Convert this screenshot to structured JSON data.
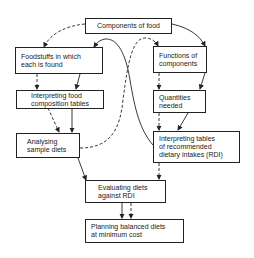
{
  "diagram": {
    "nodes": [
      {
        "id": "components",
        "label": "Components of food"
      },
      {
        "id": "foodstuffs",
        "label": "Foodstuffs in which\neach is found"
      },
      {
        "id": "functions",
        "label": "Functions of\ncomponents"
      },
      {
        "id": "interp_food",
        "label": "Interpreting food\ncomposition tables"
      },
      {
        "id": "quantities",
        "label": "Quantities\nneeded"
      },
      {
        "id": "analysing",
        "label": "Analysing\nsample diets"
      },
      {
        "id": "interp_rdi",
        "label": "Interpreting tables\nof recommended\ndietary intakes (RDI)"
      },
      {
        "id": "evaluating",
        "label": "Evaluating diets\nagainst RDI"
      },
      {
        "id": "planning",
        "label": "Planning balanced diets\nat minimum cost"
      }
    ],
    "edges": [
      {
        "from": "components",
        "to": "foodstuffs",
        "style": "dashed"
      },
      {
        "from": "components",
        "to": "functions",
        "style": "solid"
      },
      {
        "from": "foodstuffs",
        "to": "interp_food",
        "style": "dashed"
      },
      {
        "from": "foodstuffs",
        "to": "interp_food",
        "style": "solid"
      },
      {
        "from": "functions",
        "to": "quantities",
        "style": "dashed"
      },
      {
        "from": "functions",
        "to": "quantities",
        "style": "solid"
      },
      {
        "from": "interp_food",
        "to": "analysing",
        "style": "dashed"
      },
      {
        "from": "interp_food",
        "to": "analysing",
        "style": "solid"
      },
      {
        "from": "quantities",
        "to": "interp_rdi",
        "style": "dashed"
      },
      {
        "from": "quantities",
        "to": "interp_rdi",
        "style": "solid"
      },
      {
        "from": "analysing",
        "to": "functions",
        "style": "dashed"
      },
      {
        "from": "interp_rdi",
        "to": "foodstuffs",
        "style": "solid"
      },
      {
        "from": "analysing",
        "to": "evaluating",
        "style": "solid"
      },
      {
        "from": "interp_rdi",
        "to": "evaluating",
        "style": "dashed"
      },
      {
        "from": "evaluating",
        "to": "planning",
        "style": "solid"
      },
      {
        "from": "evaluating",
        "to": "planning",
        "style": "dashed"
      }
    ]
  }
}
